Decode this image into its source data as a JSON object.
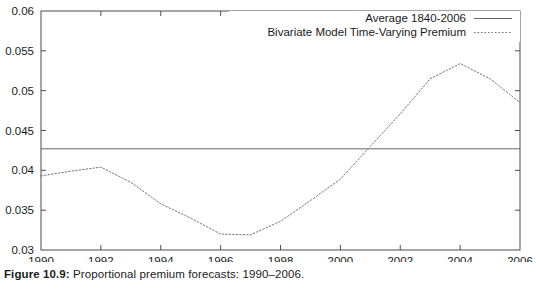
{
  "caption": {
    "label": "Figure 10.9:",
    "text": "Proportional premium forecasts: 1990–2006."
  },
  "chart_data": {
    "type": "line",
    "title": "",
    "xlabel": "",
    "ylabel": "",
    "xlim": [
      1990,
      2006
    ],
    "ylim": [
      0.03,
      0.06
    ],
    "xticks": [
      1990,
      1992,
      1994,
      1996,
      1998,
      2000,
      2002,
      2004,
      2006
    ],
    "xtick_labels": [
      "1990",
      "1992",
      "1994",
      "1996",
      "1998",
      "2000",
      "2002",
      "2004",
      "2006"
    ],
    "yticks": [
      0.03,
      0.035,
      0.04,
      0.045,
      0.05,
      0.055,
      0.06
    ],
    "ytick_labels": [
      "0.03",
      "0.035",
      "0.04",
      "0.045",
      "0.05",
      "0.055",
      "0.06"
    ],
    "grid": false,
    "legend_position": "top-right",
    "series": [
      {
        "name": "Average 1840-2006",
        "style": "solid",
        "color": "#555555",
        "constant_value": 0.0427,
        "x": [
          1990,
          2006
        ],
        "values": [
          0.0427,
          0.0427
        ]
      },
      {
        "name": "Bivariate Model Time-Varying Premium",
        "style": "dotted",
        "color": "#555555",
        "x": [
          1990,
          1991,
          1992,
          1993,
          1994,
          1995,
          1996,
          1997,
          1998,
          1999,
          2000,
          2001,
          2002,
          2003,
          2004,
          2005,
          2006
        ],
        "values": [
          0.0393,
          0.0399,
          0.0404,
          0.0385,
          0.0358,
          0.034,
          0.032,
          0.0319,
          0.0336,
          0.0362,
          0.0389,
          0.043,
          0.0471,
          0.0515,
          0.0534,
          0.0515,
          0.0485
        ]
      }
    ]
  }
}
